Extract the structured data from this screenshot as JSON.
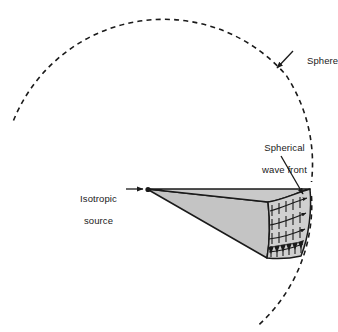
{
  "figure": {
    "background_color": "#ffffff",
    "width": 338,
    "height": 332
  },
  "labels": {
    "sphere": "Sphere",
    "wave_front_line1": "Spherical",
    "wave_front_line2": "wave front",
    "source_line1": "Isotropic",
    "source_line2": "source"
  },
  "colors": {
    "stroke": "#1a1a1a",
    "wedge_top_fill": "#c9c9c9",
    "wedge_side_fill": "#c4c4c4",
    "wedge_front_fill": "#d0d0d0",
    "text": "#1a1a1a",
    "dashed_arc": "#1a1a1a"
  },
  "geometry": {
    "sphere_arc": {
      "type": "dashed-circular-arc",
      "center_x": 150,
      "center_y": 189,
      "radius": 162,
      "start_angle_deg": 205,
      "end_angle_deg": 63,
      "dash_pattern": "5 4",
      "stroke_width": 1.6
    },
    "apex": {
      "x": 147,
      "y": 189
    },
    "wedge_top_right": {
      "x": 310,
      "y": 189
    },
    "wedge_front_bottom": {
      "x": 301,
      "y": 256
    },
    "wedge_side_bottom": {
      "x": 267,
      "y": 258
    },
    "front_face": {
      "rows": 4,
      "arrows_per_row": 6,
      "description": "curved spherical wave front face with field vector arrows"
    }
  },
  "annotations": {
    "sphere_pointer": {
      "from_x": 292,
      "from_y": 52,
      "to_x": 275,
      "to_y": 70
    },
    "wavefront_pointer": {
      "from_x": 281,
      "from_y": 156,
      "to_x": 304,
      "to_y": 196
    },
    "source_pointer": {
      "from_x": 126,
      "from_y": 189,
      "to_x": 145,
      "to_y": 189
    }
  }
}
